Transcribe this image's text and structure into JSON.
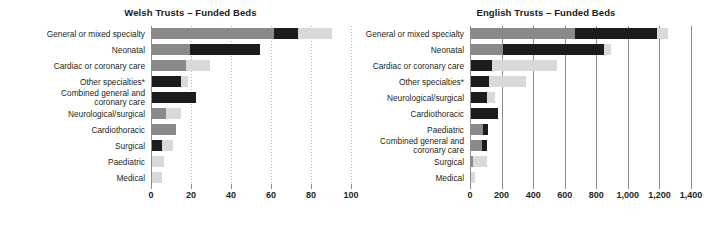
{
  "charts": [
    {
      "id": "welsh",
      "title": "Welsh Trusts – Funded Beds",
      "axis": {
        "min": 0,
        "max": 100,
        "ticks": [
          0,
          20,
          40,
          60,
          80,
          100
        ],
        "tick_labels": [
          "0",
          "20",
          "40",
          "60",
          "80",
          "100"
        ],
        "gridstyle": "dotted"
      },
      "categories": [
        "General or mixed specialty",
        "Neonatal",
        "Cardiac or coronary care",
        "Other specialties*",
        "Combined general and\ncoronary care",
        "Neurological/surgical",
        "Cardiothoracic",
        "Surgical",
        "Paediatric",
        "Medical"
      ],
      "series": [
        {
          "name": "mid-grey",
          "color": "#8a8a8a",
          "values": [
            61,
            19,
            17,
            0,
            0,
            7,
            12,
            0,
            0,
            0
          ]
        },
        {
          "name": "dark",
          "color": "#1c1c1c",
          "values": [
            12,
            35,
            0,
            14.5,
            22,
            0,
            0,
            5,
            0,
            0
          ]
        },
        {
          "name": "light-grey",
          "color": "#d9d9d9",
          "values": [
            17,
            0,
            12,
            3.5,
            0,
            7.5,
            0,
            5.5,
            6,
            5
          ]
        }
      ],
      "totals": [
        90,
        54,
        29,
        18,
        22,
        14.5,
        12,
        10.5,
        6,
        5
      ]
    },
    {
      "id": "english",
      "title": "English Trusts – Funded Beds",
      "axis": {
        "min": 0,
        "max": 1400,
        "ticks": [
          0,
          200,
          400,
          600,
          800,
          1000,
          1200,
          1400
        ],
        "tick_labels": [
          "0",
          "200",
          "400",
          "600",
          "800",
          "1,000",
          "1,200",
          "1,400"
        ],
        "gridstyle": "solid"
      },
      "categories": [
        "General or mixed specialty",
        "Neonatal",
        "Cardiac or coronary care",
        "Other specialties*",
        "Neurological/surgical",
        "Cardiothoracic",
        "Paediatric",
        "Combined general and\ncoronary care",
        "Surgical",
        "Medical"
      ],
      "series": [
        {
          "name": "mid-grey",
          "color": "#8a8a8a",
          "values": [
            660,
            200,
            0,
            0,
            0,
            0,
            75,
            70,
            10,
            0
          ]
        },
        {
          "name": "dark",
          "color": "#1c1c1c",
          "values": [
            520,
            645,
            130,
            115,
            100,
            170,
            35,
            30,
            0,
            0
          ]
        },
        {
          "name": "light-grey",
          "color": "#d9d9d9",
          "values": [
            70,
            40,
            415,
            235,
            55,
            0,
            0,
            0,
            90,
            25
          ]
        }
      ],
      "totals": [
        1250,
        885,
        545,
        350,
        155,
        170,
        110,
        100,
        100,
        25
      ]
    }
  ],
  "colors": {
    "dark": "#1c1c1c",
    "mid_grey": "#8a8a8a",
    "light_grey": "#d9d9d9",
    "axis": "#8c8c8c",
    "grid": "#b3b3b3",
    "text": "#231f20",
    "background": "#ffffff"
  },
  "chart_data": {
    "type": "bar",
    "orientation": "horizontal",
    "stacked": true,
    "grid": true,
    "legend": "none",
    "charts": [
      {
        "title": "Welsh Trusts – Funded Beds",
        "xlabel": "",
        "ylabel": "",
        "xlim": [
          0,
          100
        ],
        "xticks": [
          0,
          20,
          40,
          60,
          80,
          100
        ],
        "categories": [
          "General or mixed specialty",
          "Neonatal",
          "Cardiac or coronary care",
          "Other specialties*",
          "Combined general and coronary care",
          "Neurological/surgical",
          "Cardiothoracic",
          "Surgical",
          "Paediatric",
          "Medical"
        ],
        "series": [
          {
            "name": "mid-grey segment",
            "values": [
              61,
              19,
              17,
              0,
              0,
              7,
              12,
              0,
              0,
              0
            ]
          },
          {
            "name": "dark segment",
            "values": [
              12,
              35,
              0,
              14.5,
              22,
              0,
              0,
              5,
              0,
              0
            ]
          },
          {
            "name": "light-grey segment",
            "values": [
              17,
              0,
              12,
              3.5,
              0,
              7.5,
              0,
              5.5,
              6,
              5
            ]
          }
        ],
        "totals": [
          90,
          54,
          29,
          18,
          22,
          14.5,
          12,
          10.5,
          6,
          5
        ]
      },
      {
        "title": "English Trusts – Funded Beds",
        "xlabel": "",
        "ylabel": "",
        "xlim": [
          0,
          1400
        ],
        "xticks": [
          0,
          200,
          400,
          600,
          800,
          1000,
          1200,
          1400
        ],
        "categories": [
          "General or mixed specialty",
          "Neonatal",
          "Cardiac or coronary care",
          "Other specialties*",
          "Neurological/surgical",
          "Cardiothoracic",
          "Paediatric",
          "Combined general and coronary care",
          "Surgical",
          "Medical"
        ],
        "series": [
          {
            "name": "mid-grey segment",
            "values": [
              660,
              200,
              0,
              0,
              0,
              0,
              75,
              70,
              10,
              0
            ]
          },
          {
            "name": "dark segment",
            "values": [
              520,
              645,
              130,
              115,
              100,
              170,
              35,
              30,
              0,
              0
            ]
          },
          {
            "name": "light-grey segment",
            "values": [
              70,
              40,
              415,
              235,
              55,
              0,
              0,
              0,
              90,
              25
            ]
          }
        ],
        "totals": [
          1250,
          885,
          545,
          350,
          155,
          170,
          110,
          100,
          100,
          25
        ]
      }
    ],
    "footnote_marker": "*"
  }
}
